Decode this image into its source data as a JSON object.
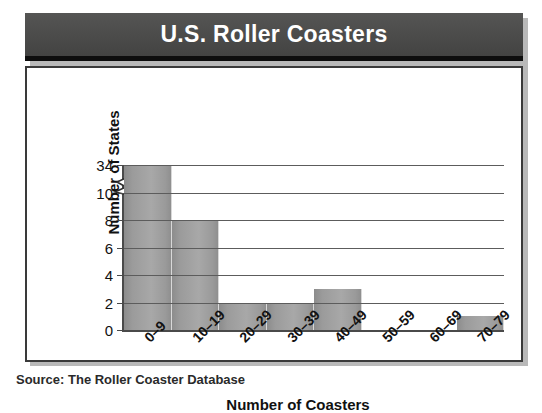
{
  "figure": {
    "title": "U.S. Roller Coasters",
    "source": "Source: The Roller Coaster Database"
  },
  "chart_data": {
    "type": "bar",
    "title": "U.S. Roller Coasters",
    "xlabel": "Number of Coasters",
    "ylabel": "Number of States",
    "categories": [
      "0–9",
      "10–19",
      "20–29",
      "30–39",
      "40–49",
      "50–59",
      "60–69",
      "70–79"
    ],
    "values": [
      34,
      8,
      2,
      2,
      3,
      0,
      0,
      1
    ],
    "ytick_labels": [
      "34",
      "10",
      "8",
      "6",
      "4",
      "2",
      "0"
    ],
    "ytick_values": [
      34,
      10,
      8,
      6,
      4,
      2,
      0
    ],
    "ylim": [
      0,
      34
    ],
    "axis_break": true,
    "axis_break_between": [
      10,
      34
    ],
    "grid": "horizontal",
    "legend": "none",
    "bar_color": "#a0a0a0",
    "title_band_color": "#4b4b4a"
  }
}
